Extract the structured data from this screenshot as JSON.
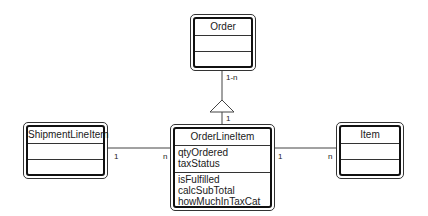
{
  "diagram": {
    "type": "UML class diagram",
    "classes": {
      "order": {
        "name": "Order",
        "attributes": [],
        "operations": []
      },
      "order_line_item": {
        "name": "OrderLineItem",
        "attributes": [
          "qtyOrdered",
          "taxStatus"
        ],
        "operations": [
          "isFulfilled",
          "calcSubTotal",
          "howMuchInTaxCat"
        ]
      },
      "shipment_line_item": {
        "name": "ShipmentLineItem",
        "attributes": [],
        "operations": []
      },
      "item": {
        "name": "Item",
        "attributes": [],
        "operations": []
      }
    },
    "relationships": [
      {
        "from": "Order",
        "to": "OrderLineItem",
        "kind": "aggregation/inheritance-triangle",
        "from_mult": "1-n",
        "to_mult": "1"
      },
      {
        "from": "ShipmentLineItem",
        "to": "OrderLineItem",
        "kind": "association",
        "from_mult": "1",
        "to_mult": "n"
      },
      {
        "from": "OrderLineItem",
        "to": "Item",
        "kind": "association",
        "from_mult": "1",
        "to_mult": "n"
      }
    ],
    "multiplicities": {
      "order_top": "1-n",
      "order_bottom": "1",
      "shipment_left": "1",
      "shipment_right": "n",
      "item_left": "1",
      "item_right": "n"
    }
  }
}
